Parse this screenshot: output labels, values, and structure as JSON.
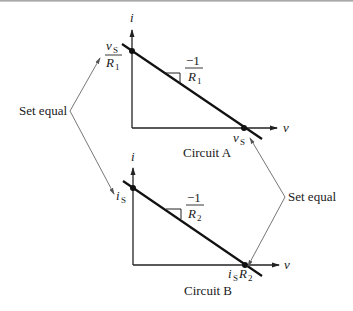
{
  "diagram": {
    "type": "circuit load-line equivalence (source transformation)",
    "circuit_a": {
      "caption": "Circuit A",
      "y_axis_label": "i",
      "x_axis_label": "v",
      "y_intercept_num": "v",
      "y_intercept_num_sub": "S",
      "y_intercept_den": "R",
      "y_intercept_den_sub": "1",
      "x_intercept": "v",
      "x_intercept_sub": "S",
      "slope_num": "−1",
      "slope_den": "R",
      "slope_den_sub": "1"
    },
    "circuit_b": {
      "caption": "Circuit B",
      "y_axis_label": "i",
      "x_axis_label": "v",
      "y_intercept": "i",
      "y_intercept_sub": "S",
      "x_intercept_a": "i",
      "x_intercept_a_sub": "S",
      "x_intercept_b": "R",
      "x_intercept_b_sub": "2",
      "slope_num": "−1",
      "slope_den": "R",
      "slope_den_sub": "2"
    },
    "annotations": {
      "left_label": "Set equal",
      "right_label": "Set equal"
    },
    "colors": {
      "ink": "#111111",
      "connector": "#666666",
      "background": "#ffffff"
    }
  }
}
